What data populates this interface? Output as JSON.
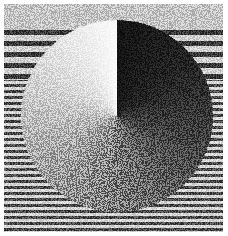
{
  "image": {
    "description": "Dithered halftone rendering of a disc shaded with a clockwise conic gradient over a horizontally striped background",
    "colors": {
      "disc_dark": "#141414",
      "disc_mid": "#7a7a7a",
      "disc_light": "#fafafa",
      "background_light": "#c4c4c4",
      "stripe_dark": "#4a4a4a",
      "stripe_light": "#d6d6d6"
    }
  }
}
